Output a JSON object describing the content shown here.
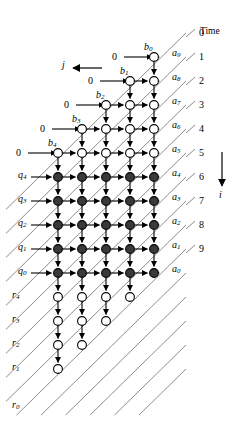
{
  "figure": {
    "title_right": "Time",
    "axis_labels": {
      "horizontal": "j",
      "vertical": "i"
    },
    "node_grid": {
      "cols": 5,
      "rows": 10,
      "col_x": [
        58,
        82,
        106,
        130,
        154
      ],
      "row_y": [
        57,
        81,
        105,
        129,
        153,
        177,
        201,
        225,
        249,
        273
      ],
      "tail_row_y": [
        297,
        321,
        345,
        369
      ],
      "hollow_rows": [
        0,
        1,
        2,
        3,
        4
      ],
      "filled_rows": [
        5,
        6,
        7,
        8,
        9
      ]
    },
    "time_ticks": [
      {
        "label": "0",
        "y": 33
      },
      {
        "label": "1",
        "y": 57
      },
      {
        "label": "2",
        "y": 81
      },
      {
        "label": "3",
        "y": 105
      },
      {
        "label": "4",
        "y": 129
      },
      {
        "label": "5",
        "y": 153
      },
      {
        "label": "6",
        "y": 177
      },
      {
        "label": "7",
        "y": 201
      },
      {
        "label": "8",
        "y": 225
      },
      {
        "label": "9",
        "y": 249
      }
    ],
    "a_labels": [
      {
        "base": "a",
        "sub": "9",
        "x": 172,
        "y": 48
      },
      {
        "base": "a",
        "sub": "8",
        "x": 172,
        "y": 72
      },
      {
        "base": "a",
        "sub": "7",
        "x": 172,
        "y": 96
      },
      {
        "base": "a",
        "sub": "6",
        "x": 172,
        "y": 120
      },
      {
        "base": "a",
        "sub": "5",
        "x": 172,
        "y": 144
      },
      {
        "base": "a",
        "sub": "4",
        "x": 172,
        "y": 168
      },
      {
        "base": "a",
        "sub": "3",
        "x": 172,
        "y": 192
      },
      {
        "base": "a",
        "sub": "2",
        "x": 172,
        "y": 216
      },
      {
        "base": "a",
        "sub": "1",
        "x": 172,
        "y": 240
      },
      {
        "base": "a",
        "sub": "0",
        "x": 172,
        "y": 264
      }
    ],
    "b_labels": [
      {
        "base": "b",
        "sub": "0",
        "x": 144,
        "y": 42
      },
      {
        "base": "b",
        "sub": "1",
        "x": 120,
        "y": 66
      },
      {
        "base": "b",
        "sub": "2",
        "x": 96,
        "y": 90
      },
      {
        "base": "b",
        "sub": "3",
        "x": 72,
        "y": 114
      },
      {
        "base": "b",
        "sub": "4",
        "x": 48,
        "y": 138
      }
    ],
    "q_labels": [
      {
        "base": "q",
        "sub": "4",
        "x": 18,
        "y": 170
      },
      {
        "base": "q",
        "sub": "3",
        "x": 18,
        "y": 194
      },
      {
        "base": "q",
        "sub": "2",
        "x": 18,
        "y": 218
      },
      {
        "base": "q",
        "sub": "1",
        "x": 18,
        "y": 242
      },
      {
        "base": "q",
        "sub": "0",
        "x": 18,
        "y": 266
      }
    ],
    "r_labels": [
      {
        "base": "r",
        "sub": "4",
        "x": 12,
        "y": 290
      },
      {
        "base": "r",
        "sub": "3",
        "x": 12,
        "y": 314
      },
      {
        "base": "r",
        "sub": "2",
        "x": 12,
        "y": 338
      },
      {
        "base": "r",
        "sub": "1",
        "x": 12,
        "y": 362
      },
      {
        "base": "r",
        "sub": "0",
        "x": 12,
        "y": 400
      }
    ],
    "zero_inputs": [
      {
        "label": "0",
        "x": 112,
        "y": 51,
        "arrow_from": 124,
        "arrow_to": 152,
        "arrow_y": 57
      },
      {
        "label": "0",
        "x": 88,
        "y": 75,
        "arrow_from": 100,
        "arrow_to": 128,
        "arrow_y": 81
      },
      {
        "label": "0",
        "x": 64,
        "y": 99,
        "arrow_from": 76,
        "arrow_to": 104,
        "arrow_y": 105
      },
      {
        "label": "0",
        "x": 40,
        "y": 123,
        "arrow_from": 52,
        "arrow_to": 80,
        "arrow_y": 129
      },
      {
        "label": "0",
        "x": 16,
        "y": 147,
        "arrow_from": 28,
        "arrow_to": 56,
        "arrow_y": 153
      }
    ]
  }
}
